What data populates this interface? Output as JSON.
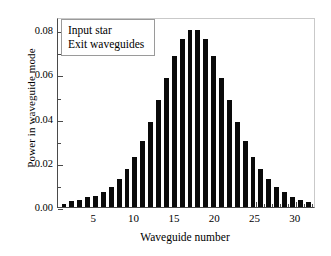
{
  "chart_data": {
    "type": "bar",
    "title": "",
    "xlabel": "Waveguide number",
    "ylabel": "Power in waveguide mode",
    "categories": [
      1,
      2,
      3,
      4,
      5,
      6,
      7,
      8,
      9,
      10,
      11,
      12,
      13,
      14,
      15,
      16,
      17,
      18,
      19,
      20,
      21,
      22,
      23,
      24,
      25,
      26,
      27,
      28,
      29,
      30,
      31,
      32
    ],
    "values": [
      0.0015,
      0.0025,
      0.0033,
      0.0046,
      0.0052,
      0.0068,
      0.0091,
      0.0125,
      0.0171,
      0.0228,
      0.03,
      0.0383,
      0.0483,
      0.0585,
      0.0682,
      0.0761,
      0.0803,
      0.0803,
      0.0761,
      0.0682,
      0.0585,
      0.0483,
      0.0383,
      0.03,
      0.0228,
      0.0171,
      0.0125,
      0.0091,
      0.0068,
      0.0046,
      0.0033,
      0.0021
    ],
    "xlim": [
      0.5,
      32.5
    ],
    "ylim": [
      0.0,
      0.086
    ],
    "yticks": [
      0.0,
      0.02,
      0.04,
      0.06,
      0.08
    ],
    "ytick_labels": [
      "0.00",
      "0.02",
      "0.04",
      "0.06",
      "0.08"
    ],
    "y_minor_ticks": [
      0.01,
      0.03,
      0.05,
      0.07
    ],
    "xticks": [
      5,
      10,
      15,
      20,
      25,
      30
    ],
    "xtick_labels": [
      "5",
      "10",
      "15",
      "20",
      "25",
      "30"
    ],
    "grid": false,
    "bar_color": "#0a0a0a",
    "legend_position": "upper-left",
    "legend_entries": [
      "Input star",
      "Exit waveguides"
    ]
  },
  "legend": {
    "line1": "Input star",
    "line2": "Exit waveguides"
  },
  "axes": {
    "x_title": "Waveguide number",
    "y_title": "Power in waveguide mode"
  },
  "colors": {
    "bar": "#0a0a0a",
    "axis": "#4a4a4a",
    "frame_light": "#c9c9c9",
    "background": "#ffffff",
    "legend_border": "#9a9a9a"
  }
}
